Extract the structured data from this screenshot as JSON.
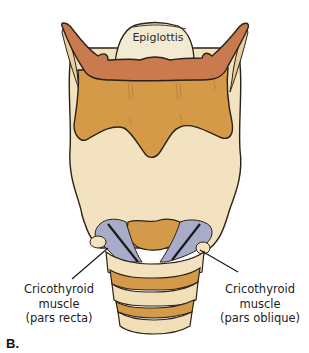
{
  "figure": {
    "panel_letter": "B."
  },
  "labels": {
    "epiglottis": "Epiglottis",
    "left": {
      "line1": "Cricothyroid",
      "line2": "muscle",
      "line3": "(pars recta)"
    },
    "right": {
      "line1": "Cricothyroid",
      "line2": "muscle",
      "line3": "(pars oblique)"
    }
  },
  "colors": {
    "background": "#ffffff",
    "outline": "#2b2118",
    "epiglottis_fill": "#f3ead2",
    "thyroid_upper_fill": "#c97a4e",
    "thyroid_fill": "#d49a48",
    "larynx_body_fill": "#f2e2bf",
    "cricoid_fill": "#d39a4a",
    "muscle_fill": "#a9acc8",
    "tracheal_ring_fill": "#f1dfb8"
  }
}
